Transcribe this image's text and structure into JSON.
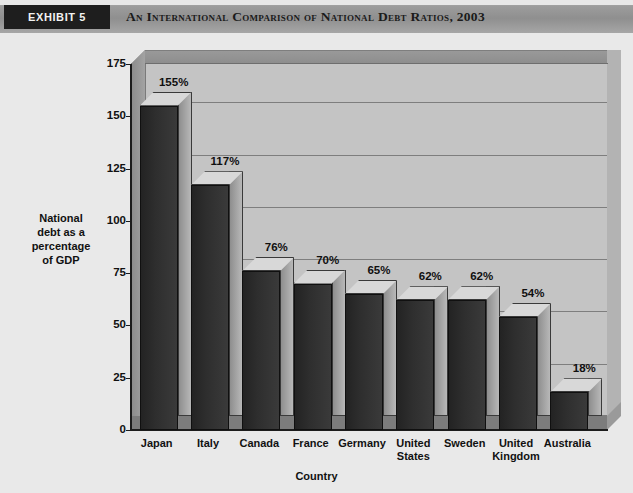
{
  "header": {
    "exhibit_label": "EXHIBIT 5",
    "title": "An International Comparison of National Debt Ratios, 2003",
    "box_color": "#1e1e1e",
    "band_color": "#9d9d9d"
  },
  "chart_data": {
    "type": "bar",
    "title": "An International Comparison of National Debt Ratios, 2003",
    "subtitle": "",
    "categories": [
      "Japan",
      "Italy",
      "Canada",
      "France",
      "Germany",
      "United States",
      "Sweden",
      "United Kingdom",
      "Australia"
    ],
    "values": [
      155,
      117,
      76,
      70,
      65,
      62,
      62,
      54,
      18
    ],
    "data_labels": [
      "155%",
      "117%",
      "76%",
      "70%",
      "65%",
      "62%",
      "62%",
      "54%",
      "18%"
    ],
    "xlabel": "Country",
    "ylabel": "National debt as a percentage of GDP",
    "ylabel_lines": [
      "National",
      "debt as a",
      "percentage",
      "of  GDP"
    ],
    "ylim": [
      0,
      175
    ],
    "yticks": [
      0,
      25,
      50,
      75,
      100,
      125,
      150,
      175
    ],
    "ytick_labels": [
      "0",
      "25",
      "50",
      "75",
      "100",
      "125",
      "150",
      "175"
    ],
    "grid": true,
    "legend": false,
    "style": "3d-column",
    "bar_color": "#2e2e2e",
    "plot_background": "#c4c4c4",
    "figure_background": "#e9e9e9"
  }
}
